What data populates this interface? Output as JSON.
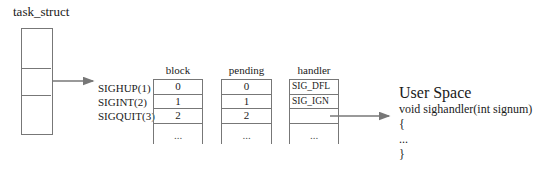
{
  "task_struct": {
    "label": "task_struct"
  },
  "signals": [
    {
      "label": "SIGHUP(1)"
    },
    {
      "label": "SIGINT(2)"
    },
    {
      "label": "SIGQUIT(3)"
    }
  ],
  "tables": {
    "block": {
      "header": "block",
      "rows": [
        "0",
        "1",
        "2",
        "..."
      ]
    },
    "pending": {
      "header": "pending",
      "rows": [
        "0",
        "1",
        "2",
        "..."
      ]
    },
    "handler": {
      "header": "handler",
      "rows": [
        "SIG_DFL",
        "SIG_IGN",
        "",
        "..."
      ]
    }
  },
  "user_space": {
    "title": "User Space",
    "lines": [
      "void sighandler(int signum)",
      "{",
      "...",
      "}"
    ]
  },
  "colors": {
    "line": "#777777",
    "text": "#1a1a1a"
  }
}
